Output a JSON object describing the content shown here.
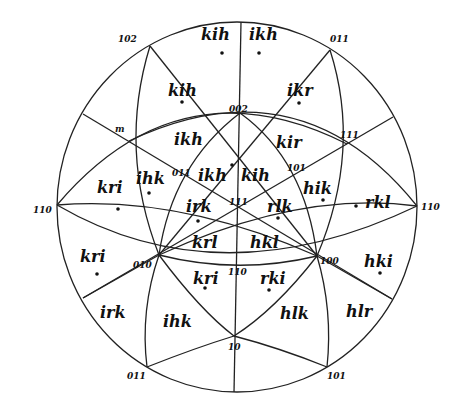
{
  "diagram": {
    "type": "stereographic-projection",
    "colors": {
      "line": "#222222",
      "text": "#111111",
      "background": "#ffffff"
    },
    "poles": [
      {
        "label": "102",
        "x": 118,
        "y": 42
      },
      {
        "label": "011",
        "x": 330,
        "y": 42
      },
      {
        "label": "002",
        "x": 229,
        "y": 112
      },
      {
        "label": "m",
        "x": 115,
        "y": 132
      },
      {
        "label": "111",
        "x": 340,
        "y": 138
      },
      {
        "label": "011",
        "x": 172,
        "y": 176
      },
      {
        "label": "101",
        "x": 287,
        "y": 171
      },
      {
        "label": "111",
        "x": 229,
        "y": 205
      },
      {
        "label": "110",
        "x": 33,
        "y": 213
      },
      {
        "label": "110",
        "x": 421,
        "y": 210
      },
      {
        "label": "010",
        "x": 133,
        "y": 268
      },
      {
        "label": "110",
        "x": 228,
        "y": 275
      },
      {
        "label": "100",
        "x": 320,
        "y": 264
      },
      {
        "label": "10",
        "x": 228,
        "y": 350
      },
      {
        "label": "011",
        "x": 127,
        "y": 379
      },
      {
        "label": "101",
        "x": 327,
        "y": 379
      }
    ],
    "regions": [
      {
        "label": "kih",
        "x": 201,
        "y": 40,
        "dot": [
          222,
          53
        ]
      },
      {
        "label": "ikh",
        "x": 249,
        "y": 40,
        "dot": [
          259,
          53
        ]
      },
      {
        "label": "kih",
        "x": 168,
        "y": 96,
        "dot": [
          182,
          102
        ]
      },
      {
        "label": "ikr",
        "x": 287,
        "y": 96,
        "dot": [
          299,
          103
        ]
      },
      {
        "label": "ikh",
        "x": 174,
        "y": 145,
        "dot": null
      },
      {
        "label": "kir",
        "x": 276,
        "y": 148,
        "dot": null
      },
      {
        "label": "ihk",
        "x": 136,
        "y": 184,
        "dot": [
          149,
          193
        ]
      },
      {
        "label": "ikh",
        "x": 198,
        "y": 181,
        "dot": [
          232,
          165
        ]
      },
      {
        "label": "kih",
        "x": 241,
        "y": 181,
        "dot": null
      },
      {
        "label": "hik",
        "x": 303,
        "y": 194,
        "dot": [
          323,
          200
        ]
      },
      {
        "label": "kri",
        "x": 97,
        "y": 193,
        "dot": [
          118,
          209
        ]
      },
      {
        "label": "irk",
        "x": 186,
        "y": 212,
        "dot": [
          198,
          221
        ]
      },
      {
        "label": "rlk",
        "x": 267,
        "y": 212,
        "dot": [
          278,
          218
        ]
      },
      {
        "label": "rkl",
        "x": 365,
        "y": 208,
        "dot": [
          356,
          206
        ]
      },
      {
        "label": "krl",
        "x": 192,
        "y": 248,
        "dot": null
      },
      {
        "label": "hkl",
        "x": 250,
        "y": 248,
        "dot": null
      },
      {
        "label": "kri",
        "x": 80,
        "y": 262,
        "dot": [
          97,
          274
        ]
      },
      {
        "label": "kri",
        "x": 193,
        "y": 284,
        "dot": [
          205,
          288
        ]
      },
      {
        "label": "rki",
        "x": 260,
        "y": 284,
        "dot": [
          269,
          290
        ]
      },
      {
        "label": "hki",
        "x": 364,
        "y": 267,
        "dot": [
          380,
          273
        ]
      },
      {
        "label": "irk",
        "x": 100,
        "y": 318,
        "dot": null
      },
      {
        "label": "ihk",
        "x": 163,
        "y": 327,
        "dot": null
      },
      {
        "label": "hlk",
        "x": 280,
        "y": 319,
        "dot": null
      },
      {
        "label": "hlr",
        "x": 346,
        "y": 317,
        "dot": null
      }
    ]
  }
}
